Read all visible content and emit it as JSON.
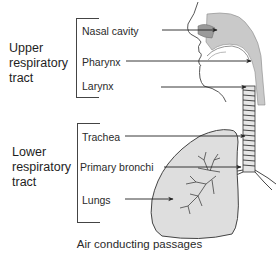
{
  "diagram": {
    "caption": "Air conducting passages",
    "groups": [
      {
        "label_lines": [
          "Upper",
          "respiratory",
          "tract"
        ],
        "parts": [
          "Nasal cavity",
          "Pharynx",
          "Larynx"
        ]
      },
      {
        "label_lines": [
          "Lower",
          "respiratory",
          "tract"
        ],
        "parts": [
          "Trachea",
          "Primary bronchi",
          "Lungs"
        ]
      }
    ],
    "colors": {
      "line": "#333333",
      "shading": "#cfcfcf",
      "lung_fill": "#dedede"
    }
  }
}
